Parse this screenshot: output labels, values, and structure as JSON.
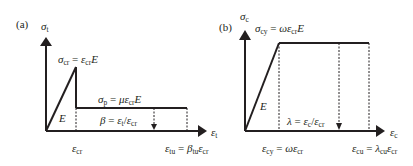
{
  "panels": [
    {
      "tag": "(a)",
      "y_axis": {
        "symbol": "σ",
        "sub": "t"
      },
      "x_axis": {
        "symbol": "ε",
        "sub": "t"
      },
      "peak_label": {
        "lhs": "σ",
        "lhs_sub": "cr",
        "eq": " = ",
        "r1": "ε",
        "r1_sub": "cr",
        "r2": "E"
      },
      "plateau_label": {
        "lhs": "σ",
        "lhs_sub": "p",
        "eq": " = ",
        "r0": "με",
        "r1_sub": "cr",
        "r2": "E"
      },
      "slope_label": "E",
      "ratio_label": {
        "lhs": "β",
        "eq": " = ",
        "n": "ε",
        "n_sub": "t",
        "slash": "/",
        "d": "ε",
        "d_sub": "cr"
      },
      "x_tick_1": {
        "sym": "ε",
        "sub": "cr"
      },
      "x_tick_2": {
        "lhs": "ε",
        "lhs_sub": "tu",
        "eq": " = ",
        "r0": "β",
        "r0_sub": "tu",
        "r1": "ε",
        "r1_sub": "cr"
      }
    },
    {
      "tag": "(b)",
      "y_axis": {
        "symbol": "σ",
        "sub": "c"
      },
      "x_axis": {
        "symbol": "ε",
        "sub": "c"
      },
      "peak_label": {
        "lhs": "σ",
        "lhs_sub": "cy",
        "eq": " = ",
        "r0": "ωε",
        "r1_sub": "cr",
        "r2": "E"
      },
      "slope_label": "E",
      "ratio_label": {
        "lhs": "λ",
        "eq": " = ",
        "n": "ε",
        "n_sub": "c",
        "slash": "/",
        "d": "ε",
        "d_sub": "cr"
      },
      "x_tick_1": {
        "lhs": "ε",
        "lhs_sub": "cy",
        "eq": " = ",
        "r0": "ωε",
        "r0_sub": "cr"
      },
      "x_tick_2": {
        "lhs": "ε",
        "lhs_sub": "cu",
        "eq": " = ",
        "r0": "λ",
        "r0_sub": "cu",
        "r1": "ε",
        "r1_sub": "cr"
      }
    }
  ],
  "colors": {
    "line": "#231f20",
    "background": "#ffffff"
  }
}
